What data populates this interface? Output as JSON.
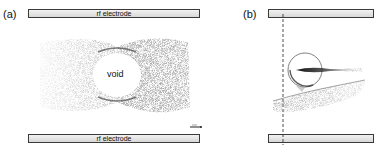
{
  "panels": {
    "a": {
      "label": "(a)",
      "top_electrode": "rf electrode",
      "bottom_electrode": "rf electrode",
      "void_label": "void",
      "scale_bar": "scale-bar"
    },
    "b": {
      "label": "(b)"
    }
  },
  "colors": {
    "electrode_border": "#3a3a3a",
    "electrode_fill": "#e6e6e6",
    "particles": "#555555",
    "background": "#ffffff"
  }
}
